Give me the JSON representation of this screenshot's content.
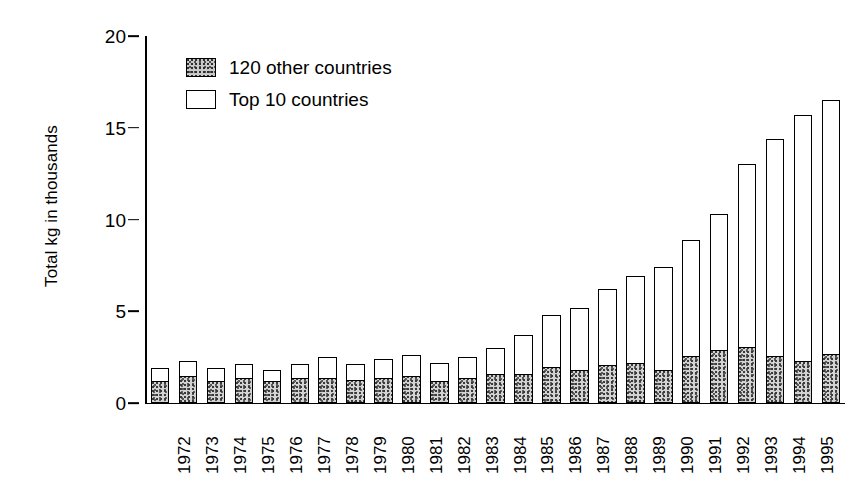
{
  "chart_data": {
    "type": "bar",
    "subtype": "stacked-vertical",
    "title": "",
    "xlabel": "",
    "ylabel": "Total kg in thousands",
    "ylim": [
      0,
      20
    ],
    "yticks": [
      0,
      5,
      10,
      15,
      20
    ],
    "ytick_labels": [
      "0",
      "5",
      "10",
      "15",
      "20"
    ],
    "grid": false,
    "legend_position": "top-left-inside",
    "categories": [
      "1972",
      "1973",
      "1974",
      "1975",
      "1976",
      "1977",
      "1978",
      "1979",
      "1980",
      "1981",
      "1982",
      "1983",
      "1984",
      "1985",
      "1986",
      "1987",
      "1988",
      "1989",
      "1990",
      "1991",
      "1992",
      "1993",
      "1994",
      "1995",
      "1996"
    ],
    "series": [
      {
        "name": "120 other countries",
        "fill": "stippled-gray",
        "color": "#c9c9c9",
        "values": [
          1.2,
          1.5,
          1.2,
          1.4,
          1.2,
          1.4,
          1.4,
          1.3,
          1.4,
          1.5,
          1.2,
          1.4,
          1.6,
          1.6,
          2.0,
          1.8,
          2.1,
          2.2,
          1.8,
          2.6,
          2.9,
          3.1,
          2.6,
          2.3,
          2.7
        ]
      },
      {
        "name": "Top 10 countries",
        "fill": "white",
        "color": "#ffffff",
        "values": [
          0.7,
          0.8,
          0.7,
          0.7,
          0.6,
          0.7,
          1.1,
          0.8,
          1.0,
          1.1,
          1.0,
          1.1,
          1.4,
          2.1,
          2.8,
          3.4,
          4.1,
          4.7,
          5.6,
          6.3,
          7.4,
          9.9,
          11.8,
          13.4,
          13.8
        ]
      }
    ],
    "totals": [
      1.9,
      2.3,
      1.9,
      2.1,
      1.8,
      2.1,
      2.5,
      2.1,
      2.4,
      2.6,
      2.2,
      2.5,
      3.0,
      3.7,
      4.8,
      5.2,
      6.2,
      6.9,
      7.4,
      8.9,
      10.3,
      13.0,
      14.4,
      15.7,
      16.5
    ]
  },
  "legend": {
    "entries": [
      {
        "label": "120 other countries",
        "swatch": "stippled-swatch"
      },
      {
        "label": "Top 10 countries",
        "swatch": "white-swatch"
      }
    ]
  },
  "axes": {
    "y_title": "Total kg in thousands"
  }
}
